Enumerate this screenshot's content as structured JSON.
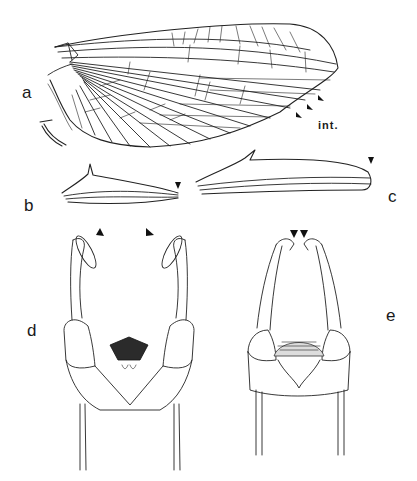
{
  "figure": {
    "background": "#ffffff",
    "ink_color": "#222222",
    "panels": [
      {
        "id": "a",
        "label": "a",
        "content": "forewing with venation, arrowheads marking intercalary veins"
      },
      {
        "id": "b",
        "label": "b",
        "content": "hind-wing / process outline with arrowhead"
      },
      {
        "id": "c",
        "label": "c",
        "content": "elongate hind wing outline with arrowhead at tip"
      },
      {
        "id": "d",
        "label": "d",
        "content": "male genitalia ventral view, forceps apices marked by arrowheads"
      },
      {
        "id": "e",
        "label": "e",
        "content": "male genitalia ventral view, converging forceps apices marked by arrowheads"
      }
    ],
    "annotations": [
      {
        "text": "int.",
        "panel": "a",
        "meaning": "intercalary veins"
      }
    ],
    "arrowhead_count": 9
  }
}
